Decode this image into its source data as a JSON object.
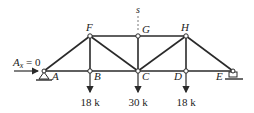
{
  "diagram": {
    "type": "truss",
    "nodes": {
      "A": {
        "label": "A",
        "x": 44,
        "y": 71
      },
      "B": {
        "label": "B",
        "x": 90,
        "y": 71
      },
      "C": {
        "label": "C",
        "x": 138,
        "y": 71
      },
      "D": {
        "label": "D",
        "x": 186,
        "y": 71
      },
      "E": {
        "label": "E",
        "x": 233,
        "y": 71
      },
      "F": {
        "label": "F",
        "x": 90,
        "y": 36
      },
      "G": {
        "label": "G",
        "x": 138,
        "y": 36
      },
      "H": {
        "label": "H",
        "x": 186,
        "y": 36
      }
    },
    "members": [
      "A-F",
      "A-B",
      "B-C",
      "C-D",
      "D-E",
      "F-G",
      "G-H",
      "H-E",
      "F-B",
      "F-C",
      "G-C",
      "H-C",
      "H-D"
    ],
    "reaction": {
      "label_main": "A",
      "label_sub": "x",
      "label_eq": " = 0"
    },
    "section_label": "s",
    "loads": [
      {
        "node": "B",
        "label": "18 k"
      },
      {
        "node": "C",
        "label": "30 k"
      },
      {
        "node": "D",
        "label": "18 k"
      }
    ],
    "supports": {
      "A": "pin",
      "E": "roller"
    },
    "colors": {
      "member": "#2a2a2a",
      "text": "#222222",
      "background": "#ffffff"
    }
  }
}
